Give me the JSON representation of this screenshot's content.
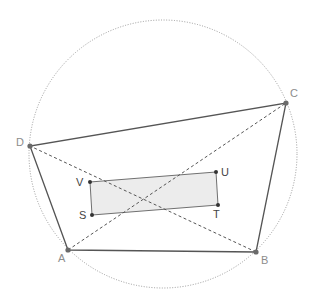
{
  "diagram": {
    "type": "cyclic-quadrilateral-with-inner-rectangle",
    "colors": {
      "circle": "#9a9a9a",
      "edge": "#555555",
      "diagonal": "#555555",
      "point": "#555555",
      "rect_fill": "#ececec",
      "rect_stroke": "#707070",
      "label_outer": "#8c8c8c",
      "label_inner": "#444444"
    },
    "circle": {
      "cx": 163,
      "cy": 154,
      "r": 134
    },
    "points": {
      "A": {
        "x": 68,
        "y": 250,
        "label": "A",
        "lx": 58,
        "ly": 262
      },
      "B": {
        "x": 256,
        "y": 252,
        "label": "B",
        "lx": 261,
        "ly": 264
      },
      "C": {
        "x": 286,
        "y": 103,
        "label": "C",
        "lx": 290,
        "ly": 97
      },
      "D": {
        "x": 30,
        "y": 146,
        "label": "D",
        "lx": 16,
        "ly": 146
      },
      "V": {
        "x": 90,
        "y": 182,
        "label": "V",
        "lx": 76,
        "ly": 186
      },
      "S": {
        "x": 92,
        "y": 215,
        "label": "S",
        "lx": 79,
        "ly": 219
      },
      "U": {
        "x": 216,
        "y": 172,
        "label": "U",
        "lx": 221,
        "ly": 176
      },
      "T": {
        "x": 218,
        "y": 205,
        "label": "T",
        "lx": 213,
        "ly": 218
      }
    },
    "quadrilateral": [
      "A",
      "B",
      "C",
      "D"
    ],
    "diagonals": [
      [
        "A",
        "C"
      ],
      [
        "B",
        "D"
      ]
    ],
    "rectangle": [
      "V",
      "U",
      "T",
      "S"
    ]
  }
}
